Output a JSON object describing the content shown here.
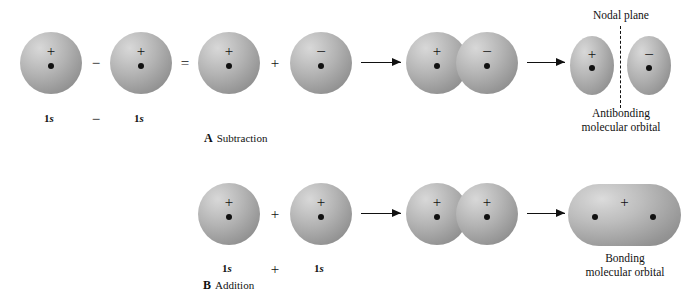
{
  "figure": {
    "type": "diagram"
  },
  "panels": [
    {
      "id": "A",
      "tag_letter": "A",
      "tag_label": "Subtraction",
      "operators": [
        "−",
        "=",
        "+"
      ],
      "orbital_labels": [
        "1s",
        "1s"
      ],
      "label_operator": "−",
      "result_caption_line1": "Antibonding",
      "result_caption_line2": "molecular orbital",
      "nodal_plane_label": "Nodal plane",
      "orbital_signs": {
        "atom1": "+",
        "atom2": "+",
        "expanded_left": "+",
        "expanded_right": "−",
        "overlap_left": "+",
        "overlap_right": "−",
        "result_left": "+",
        "result_right": "−"
      }
    },
    {
      "id": "B",
      "tag_letter": "B",
      "tag_label": "Addition",
      "operators": [
        "+"
      ],
      "orbital_labels": [
        "1s",
        "1s"
      ],
      "label_operator": "+",
      "result_caption_line1": "Bonding",
      "result_caption_line2": "molecular orbital",
      "orbital_signs": {
        "atom1": "+",
        "atom2": "+",
        "overlap_left": "+",
        "overlap_right": "+",
        "result": "+"
      }
    }
  ],
  "colors": {
    "orbital_fill": "#b4b4b4",
    "orbital_highlight": "#d8d8d8",
    "orbital_shadow": "#8e8e8e",
    "ink": "#111111",
    "background": "#ffffff"
  }
}
